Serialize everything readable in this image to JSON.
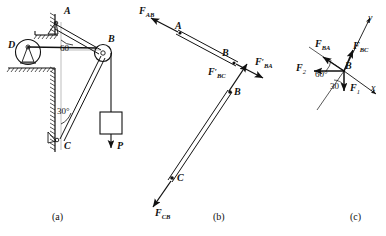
{
  "figure": {
    "captions": {
      "a": "(a)",
      "b": "(b)",
      "c": "(c)"
    }
  },
  "panel_a": {
    "name": "mechanism-assembly",
    "points": {
      "A": "A",
      "B": "B",
      "C": "C",
      "D": "D"
    },
    "angles": {
      "at_A": "60",
      "at_C": "30°"
    },
    "load": {
      "label": "P",
      "direction": "down"
    },
    "elements": [
      "wall-bracket-hatching",
      "pin-support-A",
      "pin-support-C",
      "pulley-D",
      "pulley-B",
      "bar-AB",
      "bar-CB",
      "weight-block",
      "cable-D-to-B",
      "cable-B-to-weight"
    ]
  },
  "panel_b": {
    "name": "free-body-diagrams",
    "bar_ab": {
      "point_start": "A",
      "point_end": "B",
      "force_left": "F",
      "force_left_sub": "AB",
      "force_right": "F",
      "force_right_prime": "′",
      "force_right_sub": "BA"
    },
    "bar_bc": {
      "point_start": "B",
      "point_end": "C",
      "force_top": "F",
      "force_top_prime": "′",
      "force_top_sub": "BC",
      "force_bottom": "F",
      "force_bottom_sub": "CB"
    }
  },
  "panel_c": {
    "name": "force-polygon-at-B",
    "origin_label": "B",
    "axes": {
      "x": "x",
      "y": "y"
    },
    "forces": [
      {
        "symbol": "F",
        "sub": "BA",
        "direction": "up-left"
      },
      {
        "symbol": "F",
        "sub": "BC",
        "direction": "up-right"
      },
      {
        "symbol": "F",
        "sub": "2",
        "direction": "left"
      },
      {
        "symbol": "F",
        "sub": "1",
        "direction": "down"
      }
    ],
    "angles": {
      "upper": "60°",
      "lower": "30"
    }
  },
  "colors": {
    "ink": "#111111",
    "paper": "#ffffff"
  }
}
